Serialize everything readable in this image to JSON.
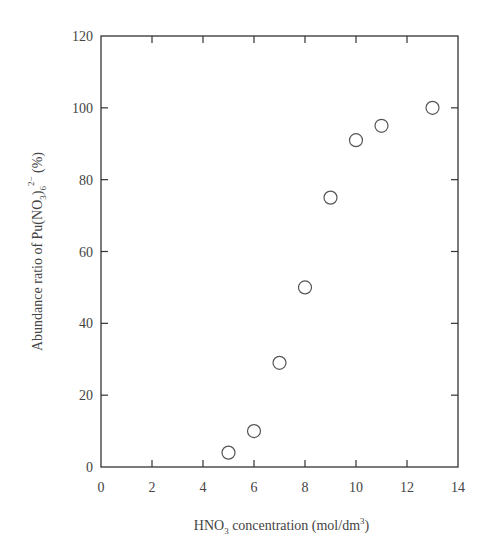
{
  "chart_data": {
    "type": "scatter",
    "title": "",
    "xlabel": "HNO3 concentration (mol/dm3)",
    "xlabel_parts": {
      "pre": "HNO",
      "sub": "3",
      "mid": " concentration (mol/dm",
      "sup": "3",
      "post": ")"
    },
    "ylabel": "Abundance ratio of Pu(NO3)6 2- (%)",
    "ylabel_parts": {
      "pre": "Abundance ratio of Pu(NO",
      "sub1": "3",
      "mid": ")",
      "sub2": "6",
      "sup": "2−",
      "post": " (%)"
    },
    "xlim": [
      0,
      14
    ],
    "ylim": [
      0,
      120
    ],
    "xticks": [
      0,
      2,
      4,
      6,
      8,
      10,
      12,
      14
    ],
    "yticks": [
      0,
      20,
      40,
      60,
      80,
      100,
      120
    ],
    "grid": false,
    "legend": null,
    "marker": "open-circle",
    "series": [
      {
        "name": "Pu(NO3)6 2- abundance",
        "x": [
          5,
          6,
          7,
          8,
          9,
          10,
          11,
          13
        ],
        "y": [
          4,
          10,
          29,
          50,
          75,
          91,
          95,
          100
        ]
      }
    ]
  },
  "colors": {
    "axis": "#333333",
    "marker": "#555555",
    "text": "#444444"
  }
}
